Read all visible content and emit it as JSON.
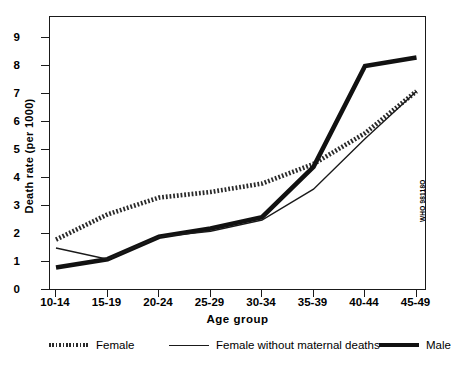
{
  "chart_data": {
    "type": "line",
    "title": "",
    "xlabel": "Age  group",
    "ylabel": "Death rate (per 1000)",
    "categories": [
      "10-14",
      "15-19",
      "20-24",
      "25-29",
      "30-34",
      "35-39",
      "40-44",
      "45-49"
    ],
    "yticks": [
      0,
      1,
      2,
      3,
      4,
      5,
      6,
      7,
      8,
      9
    ],
    "ylim": [
      0,
      9.7
    ],
    "grid": false,
    "legend_position": "bottom",
    "series": [
      {
        "name": "Female",
        "style": "dotted-thick",
        "color": "#2a2a2a",
        "values": [
          1.8,
          2.7,
          3.3,
          3.5,
          3.8,
          4.5,
          5.6,
          7.1
        ]
      },
      {
        "name": "Female without maternal deaths",
        "style": "thin-solid",
        "color": "#1a1a1a",
        "values": [
          1.5,
          1.1,
          1.9,
          2.1,
          2.5,
          3.6,
          5.4,
          7.1
        ]
      },
      {
        "name": "Male",
        "style": "thick-solid",
        "color": "#111111",
        "values": [
          0.8,
          1.1,
          1.9,
          2.2,
          2.6,
          4.4,
          8.0,
          8.3
        ]
      }
    ],
    "annotations": {
      "source_code": "WHO 98118O"
    }
  },
  "legend": {
    "entries": [
      {
        "label": "Female",
        "swatch": "dotted-line-swatch"
      },
      {
        "label": "Female without maternal deaths",
        "swatch": "thin-line-swatch"
      },
      {
        "label": "Male",
        "swatch": "thick-line-swatch"
      }
    ]
  },
  "axes": {
    "y_title": "Death rate (per 1000)",
    "x_title": "Age  group",
    "y_tick_labels": [
      "0",
      "1",
      "2",
      "3",
      "4",
      "5",
      "6",
      "7",
      "8",
      "9"
    ],
    "x_tick_labels": [
      "10-14",
      "15-19",
      "20-24",
      "25-29",
      "30-34",
      "35-39",
      "40-44",
      "45-49"
    ]
  }
}
